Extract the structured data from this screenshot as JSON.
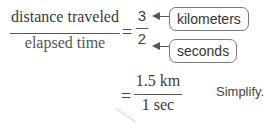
{
  "equation1": {
    "numerator": "distance traveled",
    "denominator": "elapsed time",
    "equals": "=",
    "value_numerator": "3",
    "value_denominator": "2",
    "labels": {
      "numerator_unit": "kilometers",
      "denominator_unit": "seconds"
    }
  },
  "equation2": {
    "equals": "=",
    "numerator": "1.5 km",
    "denominator": "1 sec",
    "note": "Simplify."
  }
}
